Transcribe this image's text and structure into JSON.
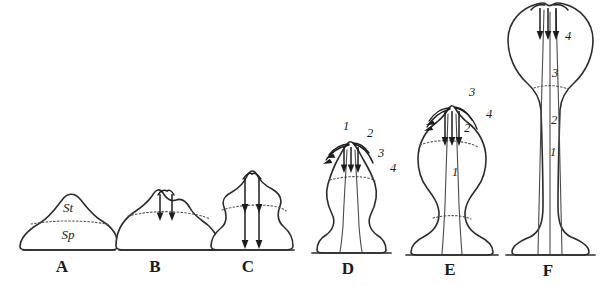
{
  "figure": {
    "background_color": "#ffffff",
    "ink_color": "#2b2b2b",
    "width": 602,
    "height": 286
  },
  "panels": [
    {
      "id": "A",
      "letter": "A",
      "stage_description": "low dome-shaped primordium with flat base",
      "tissue_labels": [
        {
          "text": "St",
          "meaning": "sterile-tissue-layer"
        },
        {
          "text": "Sp",
          "meaning": "sporogenous-tissue-layer"
        }
      ],
      "number_labels": [],
      "arrow_count": 0
    },
    {
      "id": "B",
      "letter": "B",
      "stage_description": "dome with apical papilla and two short downward arrows",
      "tissue_labels": [],
      "number_labels": [],
      "arrow_count": 2
    },
    {
      "id": "C",
      "letter": "C",
      "stage_description": "taller body with two long arrows running to the base",
      "tissue_labels": [],
      "number_labels": [],
      "arrow_count": 2
    },
    {
      "id": "D",
      "letter": "D",
      "stage_description": "swollen body on flared foot with apical tuft of arrows",
      "tissue_labels": [],
      "number_labels": [
        "1",
        "2",
        "3",
        "4"
      ],
      "arrow_count": 3
    },
    {
      "id": "E",
      "letter": "E",
      "stage_description": "goblet shape, rounded bowl, stalk and spreading foot",
      "tissue_labels": [],
      "number_labels": [
        "3",
        "4",
        "2",
        "1"
      ],
      "arrow_count": 3
    },
    {
      "id": "F",
      "letter": "F",
      "stage_description": "long stalk with large spherical head and apical nipple",
      "tissue_labels": [],
      "number_labels": [
        "4",
        "3",
        "2",
        "1"
      ],
      "arrow_count": 3
    }
  ]
}
